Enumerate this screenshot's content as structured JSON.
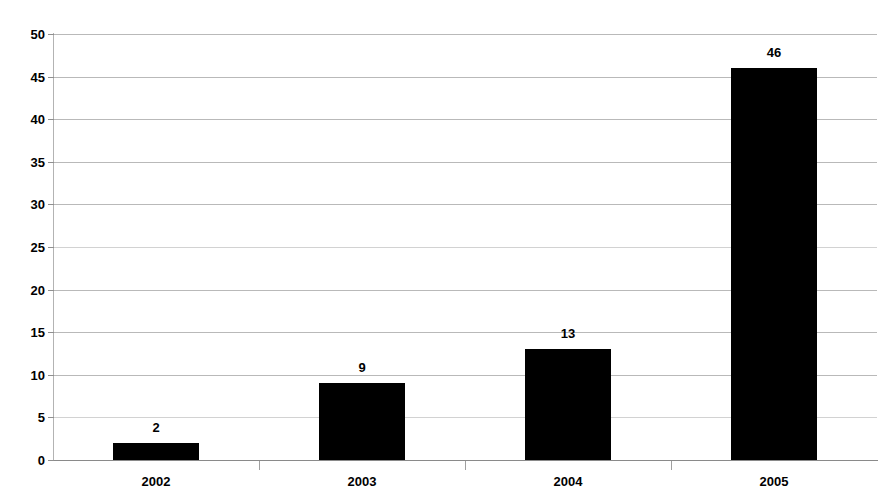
{
  "chart_data": {
    "type": "bar",
    "title": "",
    "subtitle": "",
    "xlabel": "",
    "ylabel": "",
    "categories": [
      "2002",
      "2003",
      "2004",
      "2005"
    ],
    "values": [
      2,
      9,
      13,
      46
    ],
    "data_labels": [
      "2",
      "9",
      "13",
      "46"
    ],
    "ylim": [
      0,
      50
    ],
    "ytick_labels": [
      "50",
      "45",
      "40",
      "35",
      "30",
      "25",
      "20",
      "15",
      "10",
      "5",
      "0"
    ],
    "ytick_values": [
      50,
      45,
      40,
      35,
      30,
      25,
      20,
      15,
      10,
      5,
      0
    ],
    "grid": "horizontal",
    "legend": "none",
    "series": [
      {
        "name": "",
        "values": [
          2,
          9,
          13,
          46
        ],
        "color": "#000000"
      }
    ],
    "colors": {
      "bar": "#000000",
      "gridline": "#b9b9b9",
      "axis": "#8a8a8a",
      "text": "#000000",
      "background": "#ffffff"
    }
  }
}
